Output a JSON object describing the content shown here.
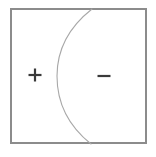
{
  "figure": {
    "canvas": {
      "width": 156,
      "height": 157,
      "background": "#ffffff"
    },
    "frame": {
      "name": "bounding-rectangle",
      "x": 11,
      "y": 9,
      "width": 135,
      "height": 134,
      "stroke": "#8c8c8c",
      "stroke_width": 1.3,
      "fill": "none"
    },
    "curve": {
      "name": "dividing-arc",
      "description": "arc bulging to the left, meeting the top and bottom edges of the rectangle",
      "start": {
        "x": 92,
        "y": 9
      },
      "end": {
        "x": 91,
        "y": 144
      },
      "leftmost": {
        "x": 57,
        "y": 76
      },
      "path": "M 92 9 C 64 31 57 55 57 76 C 57 99 66 124 91 144",
      "stroke": "#a8a8a8",
      "stroke_width": 1.1,
      "fill": "none"
    },
    "labels": [
      {
        "name": "plus-sign",
        "symbol": "+",
        "region": "left",
        "x": 35,
        "y": 75,
        "size": 13,
        "thickness": 2.2,
        "color": "#3a3a3a"
      },
      {
        "name": "minus-sign",
        "symbol": "−",
        "region": "right",
        "x": 104,
        "y": 76,
        "size": 13,
        "thickness": 2.2,
        "color": "#3a3a3a"
      }
    ]
  }
}
